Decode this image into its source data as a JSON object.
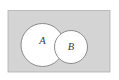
{
  "figure": {
    "kind": "venn-diagram",
    "caption": "",
    "width": 119,
    "height": 80,
    "background_color": "#ffffff"
  },
  "universal_set": {
    "name": "universe-rectangle",
    "label": "",
    "fill_color": "#d4d4d4",
    "stroke_color": "#b0b0b0",
    "stroke_width": 0.8,
    "x": 8,
    "y": 10.5,
    "width": 102,
    "height": 61.5
  },
  "sets": [
    {
      "id": "set-a",
      "label": "A",
      "cx": 42.5,
      "cy": 45,
      "r": 21.5,
      "fill_color": "#ffffff",
      "stroke_color": "#808080",
      "stroke_width": 0.9,
      "label_x": 42.5,
      "label_y": 42,
      "label_font_size": 10.5,
      "label_color": "#3a3a3a"
    },
    {
      "id": "set-b",
      "label": "B",
      "cx": 71,
      "cy": 47,
      "r": 16.5,
      "fill_color": "#ffffff",
      "stroke_color": "#808080",
      "stroke_width": 0.9,
      "label_x": 71,
      "label_y": 47.5,
      "label_font_size": 10.5,
      "label_color": "#3a3a3a"
    }
  ]
}
